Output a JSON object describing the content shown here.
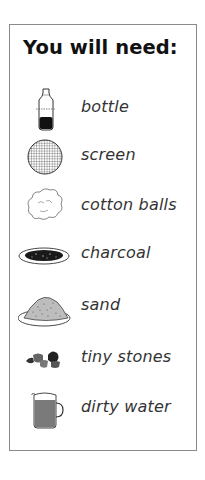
{
  "title": "You will need:",
  "items": [
    {
      "label": "bottle",
      "icon": "bottle-icon"
    },
    {
      "label": "screen",
      "icon": "screen-icon"
    },
    {
      "label": "cotton balls",
      "icon": "cotton-balls-icon"
    },
    {
      "label": "charcoal",
      "icon": "charcoal-icon"
    },
    {
      "label": "sand",
      "icon": "sand-icon"
    },
    {
      "label": "tiny stones",
      "icon": "tiny-stones-icon"
    },
    {
      "label": "dirty water",
      "icon": "dirty-water-icon"
    }
  ]
}
